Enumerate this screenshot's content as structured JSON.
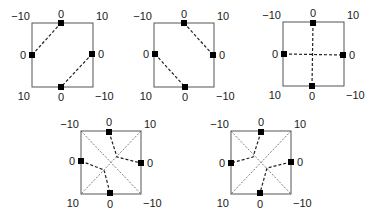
{
  "figure": {
    "panels": [
      {
        "id": "panel-1",
        "box": {
          "x": 32,
          "y": 23,
          "w": 61,
          "h": 64
        },
        "corner_labels": {
          "top_left": "−10",
          "top_right": "10",
          "bottom_left": "10",
          "bottom_right": "−10"
        },
        "edge_labels": {
          "top": "0",
          "left": "0",
          "right": "0",
          "bottom": "0"
        },
        "markers": [
          [
            61,
            23
          ],
          [
            32,
            55
          ],
          [
            92,
            54
          ],
          [
            61,
            87
          ]
        ],
        "dashed_paths": [
          [
            [
              61,
              23
            ],
            [
              32,
              55
            ]
          ],
          [
            [
              92,
              54
            ],
            [
              61,
              87
            ]
          ]
        ],
        "diagonals": false
      },
      {
        "id": "panel-2",
        "box": {
          "x": 154,
          "y": 23,
          "w": 60,
          "h": 64
        },
        "corner_labels": {
          "top_left": "−10",
          "top_right": "10",
          "bottom_left": "10",
          "bottom_right": "−10"
        },
        "edge_labels": {
          "top": "0",
          "left": "0",
          "right": "0",
          "bottom": "0"
        },
        "markers": [
          [
            184,
            23
          ],
          [
            155,
            54
          ],
          [
            213,
            55
          ],
          [
            185,
            87
          ]
        ],
        "dashed_paths": [
          [
            [
              184,
              23
            ],
            [
              213,
              55
            ]
          ],
          [
            [
              155,
              54
            ],
            [
              185,
              87
            ]
          ]
        ],
        "diagonals": false
      },
      {
        "id": "panel-3",
        "box": {
          "x": 283,
          "y": 22,
          "w": 61,
          "h": 64
        },
        "corner_labels": {
          "top_left": "−10",
          "top_right": "10",
          "bottom_left": "10",
          "bottom_right": "−10"
        },
        "edge_labels": {
          "top": "0",
          "left": "0",
          "right": "0",
          "bottom": "0"
        },
        "markers": [
          [
            313,
            23
          ],
          [
            284,
            54
          ],
          [
            343,
            55
          ],
          [
            312,
            86
          ]
        ],
        "dashed_paths": [
          [
            [
              313,
              23
            ],
            [
              312,
              86
            ]
          ],
          [
            [
              284,
              54
            ],
            [
              343,
              55
            ]
          ]
        ],
        "diagonals": false
      },
      {
        "id": "panel-4",
        "box": {
          "x": 81,
          "y": 131,
          "w": 60,
          "h": 63
        },
        "corner_labels": {
          "top_left": "−10",
          "top_right": "10",
          "bottom_left": "10",
          "bottom_right": "−10"
        },
        "edge_labels": {
          "top": "0",
          "left": "0",
          "right": "0",
          "bottom": "0"
        },
        "markers": [
          [
            109,
            132
          ],
          [
            81,
            161
          ],
          [
            141,
            163
          ],
          [
            110,
            193
          ]
        ],
        "dashed_paths": [
          [
            [
              109,
              132
            ],
            [
              117,
              157
            ],
            [
              141,
              163
            ]
          ],
          [
            [
              81,
              161
            ],
            [
              104,
              170
            ],
            [
              110,
              193
            ]
          ]
        ],
        "diagonals": true
      },
      {
        "id": "panel-5",
        "box": {
          "x": 231,
          "y": 131,
          "w": 60,
          "h": 63
        },
        "corner_labels": {
          "top_left": "−10",
          "top_right": "10",
          "bottom_left": "10",
          "bottom_right": "−10"
        },
        "edge_labels": {
          "top": "0",
          "left": "0",
          "right": "0",
          "bottom": "0"
        },
        "markers": [
          [
            261,
            132
          ],
          [
            231,
            163
          ],
          [
            291,
            162
          ],
          [
            260,
            193
          ]
        ],
        "dashed_paths": [
          [
            [
              261,
              132
            ],
            [
              253,
              157
            ],
            [
              231,
              163
            ]
          ],
          [
            [
              291,
              162
            ],
            [
              267,
              168
            ],
            [
              260,
              193
            ]
          ]
        ],
        "diagonals": true
      }
    ],
    "colors": {
      "box": "#555555",
      "dash": "#222222",
      "marker": "#000000",
      "diagonal": "#444444"
    }
  }
}
